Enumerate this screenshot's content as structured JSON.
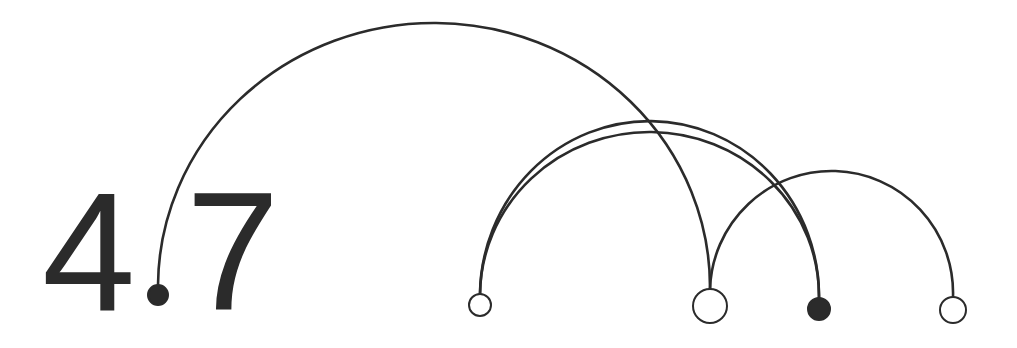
{
  "label": {
    "integer_part": "4",
    "fraction_part": "7",
    "decimal_node": "A",
    "full_text": "4.7"
  },
  "colors": {
    "stroke": "#2b2b2b",
    "filled_node": "#2b2b2b",
    "hollow_node_fill": "#ffffff",
    "background": "#ffffff"
  },
  "nodes": [
    {
      "id": "A",
      "x": 158,
      "y": 295,
      "r": 10,
      "filled": true
    },
    {
      "id": "B",
      "x": 480,
      "y": 305,
      "r": 11,
      "filled": false
    },
    {
      "id": "C",
      "x": 710,
      "y": 306,
      "r": 17,
      "filled": false
    },
    {
      "id": "D",
      "x": 819,
      "y": 309,
      "r": 11,
      "filled": true
    },
    {
      "id": "E",
      "x": 953,
      "y": 310,
      "r": 13,
      "filled": false
    }
  ],
  "edges": [
    {
      "from": "A",
      "to": "C",
      "apex_y": 25
    },
    {
      "from": "B",
      "to": "D",
      "apex_y": 123
    },
    {
      "from": "B",
      "to": "D",
      "apex_y": 134
    },
    {
      "from": "C",
      "to": "E",
      "apex_y": 175
    }
  ]
}
